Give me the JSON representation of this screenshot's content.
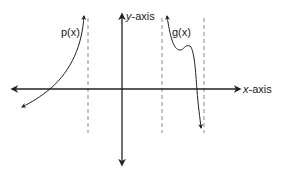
{
  "diagram": {
    "type": "function-asymptote-sketch",
    "axes": {
      "x_label_var": "x",
      "x_label_rest": "-axis",
      "y_label_var": "y",
      "y_label_rest": "-axis"
    },
    "curves": [
      {
        "name": "p(x)",
        "label": "p(x)"
      },
      {
        "name": "g(x)",
        "label": "g(x)"
      }
    ],
    "asymptotes": [
      {
        "style": "dashed",
        "orientation": "vertical",
        "position": "left of y-axis"
      },
      {
        "style": "dashed",
        "orientation": "vertical",
        "position": "right of y-axis"
      },
      {
        "style": "dashed",
        "orientation": "vertical",
        "position": "right of y-axis"
      }
    ],
    "colors": {
      "stroke": "#222222",
      "dashed": "#888888",
      "background": "#ffffff"
    }
  }
}
